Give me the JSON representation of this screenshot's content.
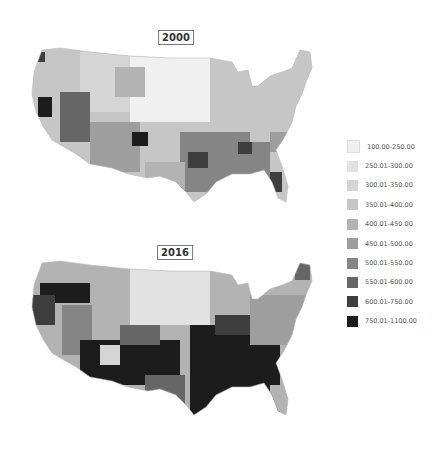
{
  "maps": [
    {
      "year": "2000"
    },
    {
      "year": "2016"
    }
  ],
  "legend": {
    "items": [
      {
        "label": "100.00-250.00",
        "color": "#f0f0f0"
      },
      {
        "label": "250.01-300.00",
        "color": "#e2e2e2"
      },
      {
        "label": "300.01-350.00",
        "color": "#d5d5d5"
      },
      {
        "label": "350.01-400.00",
        "color": "#c6c6c6"
      },
      {
        "label": "400.01-450.00",
        "color": "#b3b3b3"
      },
      {
        "label": "450.01-500.00",
        "color": "#9e9e9e"
      },
      {
        "label": "500.01-550.00",
        "color": "#858585"
      },
      {
        "label": "550.01-600.00",
        "color": "#666666"
      },
      {
        "label": "600.01-750.00",
        "color": "#3e3e3e"
      },
      {
        "label": "750.01-1100.00",
        "color": "#1c1c1c"
      }
    ]
  }
}
